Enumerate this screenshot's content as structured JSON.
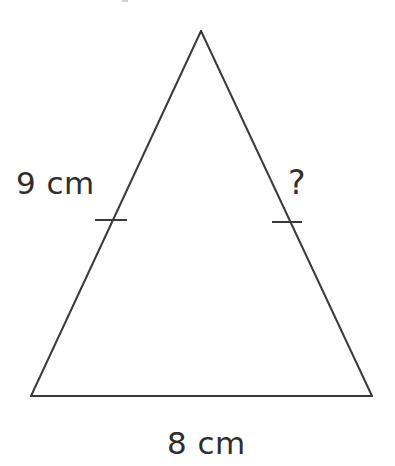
{
  "figure": {
    "kind": "geometry-diagram",
    "shape": "isosceles-triangle",
    "background_color": "#ffffff",
    "stroke_color": "#3a3a3a",
    "stroke_width": 2,
    "text_color": "#2e2e2e",
    "canvas": {
      "width": 395,
      "height": 466
    }
  },
  "vertices": {
    "apex": {
      "x": 201,
      "y": 31
    },
    "bottom_left": {
      "x": 31,
      "y": 396
    },
    "bottom_right": {
      "x": 372,
      "y": 396
    }
  },
  "sides": [
    {
      "name": "left-side",
      "from": "bottom_left",
      "to": "apex",
      "label": "9 cm",
      "tick_marks": 1
    },
    {
      "name": "right-side",
      "from": "apex",
      "to": "bottom_right",
      "label": "?",
      "tick_marks": 1
    },
    {
      "name": "base",
      "from": "bottom_left",
      "to": "bottom_right",
      "label": "8 cm",
      "tick_marks": 0
    }
  ],
  "tick_marks": [
    {
      "name": "left-congruence-tick",
      "x1": 95,
      "y1": 220,
      "x2": 127,
      "y2": 220
    },
    {
      "name": "right-congruence-tick",
      "x1": 272,
      "y1": 222,
      "x2": 302,
      "y2": 222
    }
  ],
  "labels": {
    "left_side": "9 cm",
    "right_side": "?",
    "base": "8 cm"
  }
}
